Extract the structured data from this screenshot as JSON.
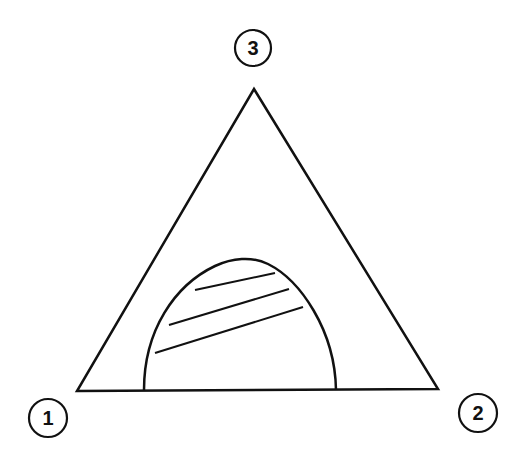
{
  "diagram": {
    "type": "ternary-phase-diagram",
    "vertices": [
      {
        "id": "1",
        "label": "1",
        "position": "bottom-left"
      },
      {
        "id": "2",
        "label": "2",
        "position": "bottom-right"
      },
      {
        "id": "3",
        "label": "3",
        "position": "top"
      }
    ],
    "features": {
      "binodal_curve": "dome-shaped two-phase region resting on edge 1-2",
      "tie_lines": 3
    },
    "colors": {
      "stroke": "#111111",
      "background": "#ffffff"
    }
  }
}
